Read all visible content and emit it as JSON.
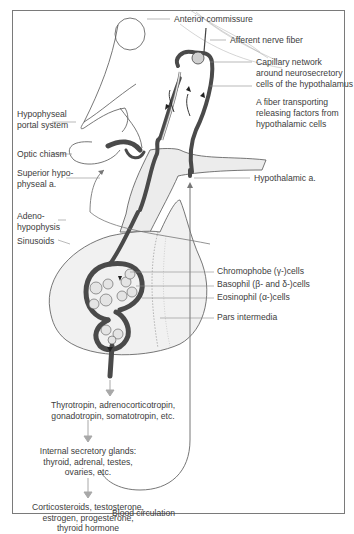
{
  "diagram": {
    "labels": {
      "anterior_commissure": "Anterior commissure",
      "afferent_nerve_fiber": "Afferent nerve fiber",
      "capillary_network_1": "Capillary network",
      "capillary_network_2": "around neurosecretory",
      "capillary_network_3": "cells of the hypothalamus",
      "hypophyseal_portal_1": "Hypophyseal",
      "hypophyseal_portal_2": "portal system",
      "fiber_transport_1": "A fiber transporting",
      "fiber_transport_2": "releasing factors from",
      "fiber_transport_3": "hypothalamic cells",
      "optic_chiasm": "Optic chiasm",
      "superior_hypophyseal_1": "Superior hypo-",
      "superior_hypophyseal_2": "physeal a.",
      "hypothalamic_a": "Hypothalamic a.",
      "adenohypophysis_1": "Adeno-",
      "adenohypophysis_2": "hypophysis",
      "sinusoids": "Sinusoids",
      "chromophobe": "Chromophobe (γ-)cells",
      "basophil": "Basophil (β- and δ-)cells",
      "eosinophil": "Eosinophil (α-)cells",
      "pars_intermedia": "Pars intermedia"
    },
    "flow": {
      "step1_line1": "Thyrotropin, adrenocorticotropin,",
      "step1_line2": "gonadotropin, somatotropin, etc.",
      "step2_line1": "Internal secretory glands:",
      "step2_line2": "thyroid, adrenal, testes,",
      "step2_line3": "ovaries, etc.",
      "step3_line1": "Corticosteroids, testosterone,",
      "step3_line2": "estrogen, progesterone,",
      "step3_line3": "thyroid hormone",
      "blood_circulation": "Blood circulation"
    },
    "colors": {
      "vessel_dark": "#4a4a4a",
      "gland_fill": "#e9e9e9",
      "arrow_gray": "#a8a8a8",
      "leader_line": "#8a8a8a",
      "frame": "#7a7a7a"
    }
  }
}
